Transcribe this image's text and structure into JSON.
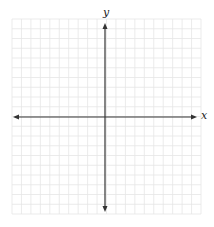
{
  "figure": {
    "type": "coordinate-plane",
    "x_axis_label": "x",
    "y_axis_label": "y",
    "grid": {
      "columns": 20,
      "rows": 20,
      "left": 12,
      "top": 19,
      "right": 201,
      "bottom": 214,
      "color": "#e6e6e6"
    },
    "origin": {
      "x": 105,
      "y": 117
    },
    "x_axis": {
      "from": 13,
      "to": 197
    },
    "y_axis": {
      "from": 23,
      "to": 212
    },
    "axis_color": "#333333",
    "arrows": [
      "left",
      "right",
      "up",
      "down"
    ]
  }
}
